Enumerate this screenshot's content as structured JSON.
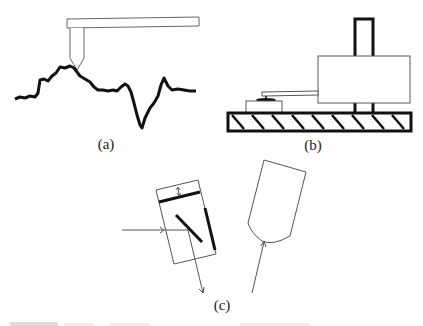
{
  "figure": {
    "panels": [
      {
        "id": "a",
        "label": "(a)",
        "description": "Stylus probe tracing a rough surface profile"
      },
      {
        "id": "b",
        "label": "(b)",
        "description": "Sensor head on a hatched base with arm extending to a contact pad"
      },
      {
        "id": "c",
        "label": "(c)",
        "description": "Tilted optical sensor with mirrors and incident/reflected rays, and a rounded probe tip with incoming ray"
      }
    ],
    "caption_partial": ""
  },
  "colors": {
    "background": "#ffffff",
    "ink": "#111111",
    "thin_line": "#555555"
  }
}
